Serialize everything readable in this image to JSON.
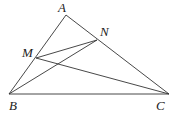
{
  "diagram": {
    "type": "geometry-triangle",
    "points": {
      "A": {
        "label": "A",
        "x": 66,
        "y": 15,
        "lx": 58,
        "ly": 12
      },
      "B": {
        "label": "B",
        "x": 9,
        "y": 94,
        "lx": 9,
        "ly": 110
      },
      "C": {
        "label": "C",
        "x": 169,
        "y": 94,
        "lx": 156,
        "ly": 110
      },
      "M": {
        "label": "M",
        "x": 36,
        "y": 58,
        "lx": 22,
        "ly": 57
      },
      "N": {
        "label": "N",
        "x": 97,
        "y": 40,
        "lx": 100,
        "ly": 36
      }
    },
    "segments": [
      {
        "from": "A",
        "to": "B"
      },
      {
        "from": "A",
        "to": "C"
      },
      {
        "from": "B",
        "to": "C"
      },
      {
        "from": "M",
        "to": "N"
      },
      {
        "from": "M",
        "to": "C"
      },
      {
        "from": "B",
        "to": "N"
      }
    ],
    "colors": {
      "line": "#333333",
      "label": "#222222",
      "background": "#ffffff"
    }
  }
}
